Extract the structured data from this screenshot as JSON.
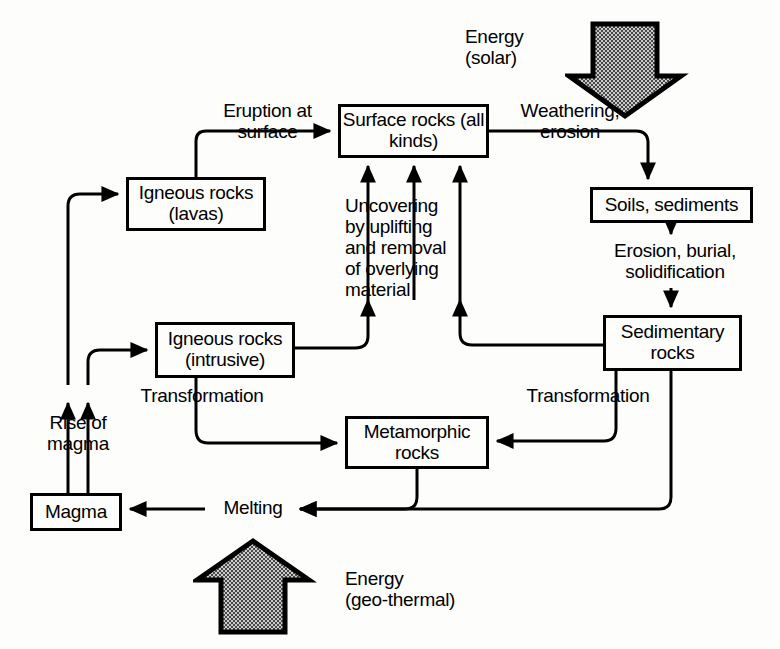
{
  "diagram": {
    "type": "flow-diagram",
    "background_color": "#fdfdfb",
    "line_color": "#000000",
    "energy_fill_color": "#9a9a9a",
    "nodes": [
      {
        "id": "surface_rocks",
        "label": "Surface rocks\n(all kinds)",
        "x": 338,
        "y": 104,
        "w": 151,
        "h": 54
      },
      {
        "id": "igneous_lavas",
        "label": "Igneous rocks\n(lavas)",
        "x": 126,
        "y": 177,
        "w": 140,
        "h": 54
      },
      {
        "id": "soils",
        "label": "Soils, sediments",
        "x": 590,
        "y": 187,
        "w": 163,
        "h": 36
      },
      {
        "id": "igneous_intr",
        "label": "Igneous rocks\n(intrusive)",
        "x": 155,
        "y": 322,
        "w": 140,
        "h": 56
      },
      {
        "id": "sedimentary",
        "label": "Sedimentary\nrocks",
        "x": 603,
        "y": 315,
        "w": 139,
        "h": 56
      },
      {
        "id": "metamorphic",
        "label": "Metamorphic\nrocks",
        "x": 345,
        "y": 416,
        "w": 144,
        "h": 53
      },
      {
        "id": "magma",
        "label": "Magma",
        "x": 30,
        "y": 493,
        "w": 92,
        "h": 38
      }
    ],
    "edge_labels": [
      {
        "id": "eruption",
        "text": "Eruption at\nsurface",
        "x": 195,
        "y": 101,
        "w": 145
      },
      {
        "id": "weathering",
        "text": "Weathering,\nerosion",
        "x": 500,
        "y": 101,
        "w": 140
      },
      {
        "id": "uncovering",
        "text": "Uncovering\nby uplifting\nand removal\nof overlying\nmaterial",
        "x": 345,
        "y": 196,
        "w": 115
      },
      {
        "id": "erosion_burial",
        "text": "Erosion, burial,\nsolidification",
        "x": 596,
        "y": 241,
        "w": 158
      },
      {
        "id": "transformation_l",
        "text": "Transformation",
        "x": 122,
        "y": 386,
        "w": 160
      },
      {
        "id": "transformation_r",
        "text": "Transformation",
        "x": 508,
        "y": 386,
        "w": 160
      },
      {
        "id": "rise_of_magma",
        "text": "Rise of\nmagma",
        "x": 28,
        "y": 413,
        "w": 100
      },
      {
        "id": "melting",
        "text": "Melting",
        "x": 208,
        "y": 498,
        "w": 90
      }
    ],
    "energy_inputs": [
      {
        "id": "solar",
        "label": "Energy\n(solar)",
        "direction": "down",
        "label_x": 465,
        "label_y": 27,
        "label_w": 100
      },
      {
        "id": "geothermal",
        "label": "Energy\n(geo-thermal)",
        "direction": "up",
        "label_x": 345,
        "label_y": 569,
        "label_w": 200
      }
    ]
  }
}
